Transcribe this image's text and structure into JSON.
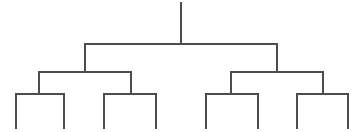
{
  "figure": {
    "title": "",
    "type": "dendrogram",
    "background_color": "#ffffff",
    "line_color": "#4d4d4d",
    "line_width": 1.1,
    "width": 361,
    "height": 132,
    "orientation": "top-down",
    "leaf_count": 8,
    "depth_levels": 4,
    "labels_visible": false,
    "axis_visible": false
  },
  "chart_data": {
    "type": "dendrogram",
    "title": "",
    "subtitle": "",
    "xlabel": "",
    "ylabel": "",
    "grid": false,
    "legend": false,
    "orientation": "top-down",
    "leaf_count": 8,
    "leaves": [
      {
        "id": "L1",
        "x": 16
      },
      {
        "id": "L2",
        "x": 64
      },
      {
        "id": "L3",
        "x": 104
      },
      {
        "id": "L4",
        "x": 156
      },
      {
        "id": "L5",
        "x": 206
      },
      {
        "id": "L6",
        "x": 258
      },
      {
        "id": "L7",
        "x": 297
      },
      {
        "id": "L8",
        "x": 348
      }
    ],
    "merges": [
      {
        "id": "M1",
        "children": [
          "L1",
          "L2"
        ],
        "left_x": 16,
        "right_x": 64,
        "y": 94,
        "center_x": 40,
        "leaf_bottom_y": 129
      },
      {
        "id": "M2",
        "children": [
          "L3",
          "L4"
        ],
        "left_x": 104,
        "right_x": 156,
        "y": 94,
        "center_x": 130,
        "leaf_bottom_y": 129
      },
      {
        "id": "M3",
        "children": [
          "L5",
          "L6"
        ],
        "left_x": 206,
        "right_x": 258,
        "y": 94,
        "center_x": 232,
        "leaf_bottom_y": 129
      },
      {
        "id": "M4",
        "children": [
          "L7",
          "L8"
        ],
        "left_x": 297,
        "right_x": 348,
        "y": 94,
        "center_x": 322,
        "leaf_bottom_y": 129
      },
      {
        "id": "M5",
        "children": [
          "M1",
          "M2"
        ],
        "left_x": 39,
        "right_x": 131,
        "y": 72,
        "center_x": 85
      },
      {
        "id": "M6",
        "children": [
          "M3",
          "M4"
        ],
        "left_x": 231,
        "right_x": 323,
        "y": 72,
        "center_x": 277
      },
      {
        "id": "M7",
        "children": [
          "M5",
          "M6"
        ],
        "left_x": 85,
        "right_x": 277,
        "y": 44,
        "center_x": 181
      }
    ],
    "root": {
      "id": "R",
      "x": 181,
      "top_y": 2,
      "bottom_y": 44
    }
  }
}
